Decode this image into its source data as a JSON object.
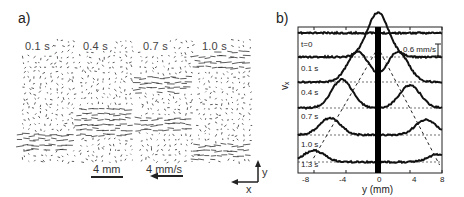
{
  "panel_a": {
    "label": "a)",
    "frames": [
      {
        "time": "0.1 s",
        "jet_rows": [
          0.82
        ]
      },
      {
        "time": "0.4 s",
        "jet_rows": [
          0.62,
          0.72
        ]
      },
      {
        "time": "0.7 s",
        "jet_rows": [
          0.36,
          0.68
        ]
      },
      {
        "time": "1.0 s",
        "jet_rows": [
          0.16,
          0.9
        ]
      }
    ],
    "length_scale": "4 mm",
    "velocity_scale": "4 mm/s",
    "axes": {
      "x": "x",
      "y": "y"
    }
  },
  "panel_b": {
    "label": "b)",
    "velocity_scale": "0.6 mm/s",
    "ylabel": "vₓ",
    "xlabel": "y (mm)",
    "xticks": [
      "-8",
      "-4",
      "0",
      "4",
      "8"
    ]
  },
  "chart_data": {
    "type": "line",
    "title": "",
    "xlabel": "y (mm)",
    "ylabel": "v_x (stacked traces, scale bar 0.6 mm/s)",
    "xlim": [
      -10,
      8
    ],
    "xticks": [
      -8,
      -4,
      0,
      4,
      8
    ],
    "grid": false,
    "annotations": [
      "thick vertical bar at y=0",
      "dashed diagonal lines tracing peak positions",
      "dotted baseline per trace",
      "0.6 mm/s scale bar"
    ],
    "series": [
      {
        "name": "t=0",
        "peaks": []
      },
      {
        "name": "0.1 s",
        "peaks": [
          {
            "y": -0.3,
            "height": 0.6
          },
          {
            "y": 0.3,
            "height": 0.6
          }
        ]
      },
      {
        "name": "0.4 s",
        "peaks": [
          {
            "y": -2.5,
            "height": 0.8
          },
          {
            "y": 2.5,
            "height": 0.8
          }
        ]
      },
      {
        "name": "0.7 s",
        "peaks": [
          {
            "y": -4.5,
            "height": 0.75
          },
          {
            "y": 4.0,
            "height": 0.6
          }
        ]
      },
      {
        "name": "1.0 s",
        "peaks": [
          {
            "y": -6.0,
            "height": 0.45
          },
          {
            "y": 6.0,
            "height": 0.4
          }
        ]
      },
      {
        "name": "1.3 s",
        "peaks": [
          {
            "y": -8.0,
            "height": 0.3
          },
          {
            "y": 7.5,
            "height": 0.2
          }
        ]
      }
    ]
  }
}
